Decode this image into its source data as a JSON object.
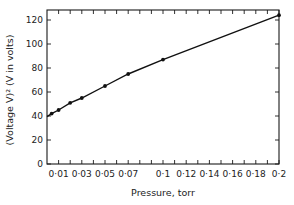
{
  "chart_data": {
    "type": "line",
    "title": "",
    "xlabel": "Pressure, torr",
    "ylabel": "(Voltage V)²  (V in volts)",
    "xlim": [
      0,
      0.2
    ],
    "ylim": [
      0,
      130
    ],
    "grid": false,
    "legend": null,
    "x_ticks": [
      0.01,
      0.03,
      0.05,
      0.07,
      0.1,
      0.12,
      0.14,
      0.16,
      0.18,
      0.2
    ],
    "x_tick_labels": [
      "0·01",
      "0·03",
      "0·05",
      "0·07",
      "0·1",
      "0·12",
      "0·14",
      "0·16",
      "0·18",
      "0·2"
    ],
    "x_minor_ticks": [
      0.01,
      0.02,
      0.03,
      0.04,
      0.05,
      0.06,
      0.07,
      0.08,
      0.09,
      0.1,
      0.11,
      0.12,
      0.13,
      0.14,
      0.15,
      0.16,
      0.17,
      0.18,
      0.19,
      0.2
    ],
    "y_ticks": [
      0,
      20,
      40,
      60,
      80,
      100,
      120
    ],
    "y_tick_labels": [
      "0",
      "20",
      "40",
      "60",
      "80",
      "100",
      "120"
    ],
    "series": [
      {
        "name": "(Voltage V)^2 vs Pressure",
        "x": [
          0.004,
          0.01,
          0.02,
          0.03,
          0.05,
          0.07,
          0.1,
          0.2
        ],
        "values": [
          42,
          45,
          51,
          55,
          65,
          75,
          87,
          124
        ],
        "line_start": [
          0.0,
          39.5
        ],
        "marker": "dot"
      }
    ]
  }
}
